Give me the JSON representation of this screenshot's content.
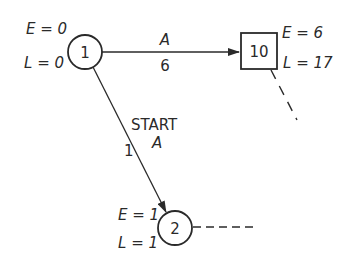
{
  "diagram": {
    "type": "activity-on-arrow network fragment",
    "colors": {
      "ink": "#2a2a2a",
      "background": "#ffffff"
    },
    "nodes": [
      {
        "id": "1",
        "shape": "circle",
        "label": "1",
        "E_label": "E = 0",
        "L_label": "L = 0",
        "E": 0,
        "L": 0
      },
      {
        "id": "10",
        "shape": "square",
        "label": "10",
        "E_label": "E = 6",
        "L_label": "L = 17",
        "E": 6,
        "L": 17
      },
      {
        "id": "2",
        "shape": "circle",
        "label": "2",
        "E_label": "E = 1",
        "L_label": "L = 1",
        "E": 1,
        "L": 1
      }
    ],
    "edges": [
      {
        "from": "1",
        "to": "10",
        "activity": "A",
        "duration": "6",
        "style": "solid-arrow"
      },
      {
        "from": "1",
        "to": "2",
        "activity": "START A",
        "activity_line1": "START",
        "activity_line2": "A",
        "duration": "1",
        "style": "solid-arrow"
      },
      {
        "from": "10",
        "to": null,
        "style": "dashed",
        "direction": "down-right"
      },
      {
        "from": "2",
        "to": null,
        "style": "dashed",
        "direction": "right"
      }
    ]
  },
  "labels": {
    "n1_label": "1",
    "n1_E": "E = 0",
    "n1_L": "L = 0",
    "n10_label": "10",
    "n10_E": "E = 6",
    "n10_L": "L = 17",
    "n2_label": "2",
    "n2_E": "E = 1",
    "n2_L": "L = 1",
    "edge_1_10_activity": "A",
    "edge_1_10_duration": "6",
    "edge_1_2_start": "START",
    "edge_1_2_activity": "A",
    "edge_1_2_duration": "1"
  }
}
